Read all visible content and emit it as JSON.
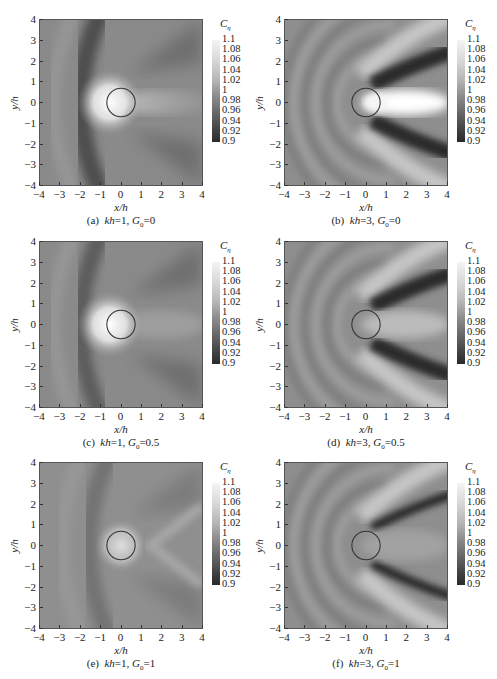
{
  "figure": {
    "colorbar": {
      "title": "C",
      "title_sub": "η",
      "ticks": [
        "1.1",
        "1.08",
        "1.06",
        "1.04",
        "1.02",
        "1",
        "0.98",
        "0.96",
        "0.94",
        "0.92",
        "0.9"
      ]
    },
    "xlabel": "x/h",
    "ylabel": "y/h",
    "xticks": [
      "−4",
      "−3",
      "−2",
      "−1",
      "0",
      "1",
      "2",
      "3",
      "4"
    ],
    "yticks": [
      "4",
      "3",
      "2",
      "1",
      "0",
      "−1",
      "−2",
      "−3",
      "−4"
    ],
    "panels": [
      {
        "id": "a",
        "prefix": "(a)",
        "kh_label": "kh",
        "kh": "=1,",
        "g_label": "G",
        "g_sub": "0",
        "g_val": "=0"
      },
      {
        "id": "b",
        "prefix": "(b)",
        "kh_label": "kh",
        "kh": "=3,",
        "g_label": "G",
        "g_sub": "0",
        "g_val": "=0"
      },
      {
        "id": "c",
        "prefix": "(c)",
        "kh_label": "kh",
        "kh": "=1,",
        "g_label": "G",
        "g_sub": "0",
        "g_val": "=0.5"
      },
      {
        "id": "d",
        "prefix": "(d)",
        "kh_label": "kh",
        "kh": "=3,",
        "g_label": "G",
        "g_sub": "0",
        "g_val": "=0.5"
      },
      {
        "id": "e",
        "prefix": "(e)",
        "kh_label": "kh",
        "kh": "=1,",
        "g_label": "G",
        "g_sub": "0",
        "g_val": "=1"
      },
      {
        "id": "f",
        "prefix": "(f)",
        "kh_label": "kh",
        "kh": "=3,",
        "g_label": "G",
        "g_sub": "0",
        "g_val": "=1"
      }
    ]
  },
  "chart_data": [
    {
      "type": "heatmap",
      "title": "(a) kh=1, G0=0",
      "xlabel": "x/h",
      "ylabel": "y/h",
      "xlim": [
        -4,
        4
      ],
      "ylim": [
        -4,
        4
      ],
      "colorbar": {
        "label": "Cη",
        "range": [
          0.9,
          1.1
        ],
        "ticks": [
          0.9,
          0.92,
          0.94,
          0.96,
          0.98,
          1,
          1.02,
          1.04,
          1.06,
          1.08,
          1.1
        ]
      },
      "features": {
        "cylinder": {
          "center": [
            0,
            0
          ],
          "radius": 0.7
        },
        "max_region": "bright ~1.1 at x≈-0.7..0, y≈0 (upstream face)",
        "min_region": "dark arc ~0.92 at x≈-2.5",
        "wake": "moderately bright tail ~1.02 downstream along y=0"
      }
    },
    {
      "type": "heatmap",
      "title": "(b) kh=3, G0=0",
      "xlabel": "x/h",
      "ylabel": "y/h",
      "xlim": [
        -4,
        4
      ],
      "ylim": [
        -4,
        4
      ],
      "colorbar": {
        "label": "Cη",
        "range": [
          0.9,
          1.1
        ]
      },
      "features": {
        "cylinder": {
          "center": [
            0,
            0
          ],
          "radius": 0.7
        },
        "max_region": "bright lobe ~1.1 downstream x≈0.5..3, y≈0",
        "min_region": "dark diagonal bands ~0.9 from (0.5,±1) to (4,±2)",
        "upstream": "concentric ripple arcs ~0.98-1.02"
      }
    },
    {
      "type": "heatmap",
      "title": "(c) kh=1, G0=0.5",
      "xlabel": "x/h",
      "ylabel": "y/h",
      "xlim": [
        -4,
        4
      ],
      "ylim": [
        -4,
        4
      ],
      "colorbar": {
        "label": "Cη",
        "range": [
          0.9,
          1.1
        ]
      },
      "features": {
        "cylinder": {
          "center": [
            0,
            0
          ],
          "radius": 0.7
        },
        "max_region": "bright ~1.1 at upstream face",
        "min_region": "dark arc ~0.94 at x≈-2.3"
      }
    },
    {
      "type": "heatmap",
      "title": "(d) kh=3, G0=0.5",
      "xlabel": "x/h",
      "ylabel": "y/h",
      "xlim": [
        -4,
        4
      ],
      "ylim": [
        -4,
        4
      ],
      "colorbar": {
        "label": "Cη",
        "range": [
          0.9,
          1.1
        ]
      },
      "features": {
        "cylinder": {
          "center": [
            0,
            0
          ],
          "radius": 0.7
        },
        "max_region": "moderate bright lobe ~1.04 downstream",
        "min_region": "dark diagonal bands ~0.9"
      }
    },
    {
      "type": "heatmap",
      "title": "(e) kh=1, G0=1",
      "xlabel": "x/h",
      "ylabel": "y/h",
      "xlim": [
        -4,
        4
      ],
      "ylim": [
        -4,
        4
      ],
      "colorbar": {
        "label": "Cη",
        "range": [
          0.9,
          1.1
        ]
      },
      "features": {
        "cylinder": {
          "center": [
            0,
            0
          ],
          "radius": 0.7
        },
        "max_region": "bright ~1.06 inside/around cylinder",
        "min_region": "faint dark arc ~0.96 at x≈-2"
      }
    },
    {
      "type": "heatmap",
      "title": "(f) kh=3, G0=1",
      "xlabel": "x/h",
      "ylabel": "y/h",
      "xlim": [
        -4,
        4
      ],
      "ylim": [
        -4,
        4
      ],
      "colorbar": {
        "label": "Cη",
        "range": [
          0.9,
          1.1
        ]
      },
      "features": {
        "cylinder": {
          "center": [
            0,
            0
          ],
          "radius": 0.7
        },
        "max_region": "bright bands flanking the dark ones",
        "min_region": "narrow dark diagonal bands ~0.9 from (0.5,±1) to (3,±2)"
      }
    }
  ]
}
